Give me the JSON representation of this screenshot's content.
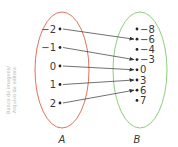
{
  "credit": {
    "line1": "Banco de imagens/",
    "line2": "Arquivo da editora"
  },
  "sets": {
    "A": {
      "label": "A",
      "color": "#e0735a",
      "elements": [
        "−2",
        "−1",
        "0",
        "1",
        "2"
      ]
    },
    "B": {
      "label": "B",
      "color": "#8fcf7a",
      "elements": [
        "−8",
        "−6",
        "−4",
        "−3",
        "0",
        "3",
        "6",
        "7"
      ]
    }
  },
  "mapping": [
    {
      "from": 0,
      "to": 1
    },
    {
      "from": 1,
      "to": 3
    },
    {
      "from": 2,
      "to": 4
    },
    {
      "from": 3,
      "to": 5
    },
    {
      "from": 4,
      "to": 6
    }
  ],
  "colors": {
    "text": "#3a3a3a",
    "arrow": "#333333"
  }
}
